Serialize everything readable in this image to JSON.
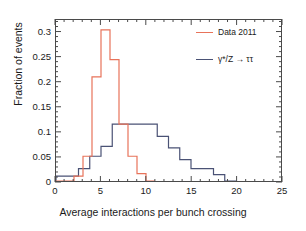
{
  "figure": {
    "background_color": "#ffffff",
    "frame_color": "#4a4a4a"
  },
  "axes": {
    "x": {
      "label": "Average interactions per bunch crossing",
      "ticks": [
        0,
        5,
        10,
        15,
        20,
        25
      ],
      "tick_labels": [
        "0",
        "5",
        "10",
        "15",
        "20",
        "25"
      ],
      "range": [
        0,
        25
      ],
      "minor_ticks_per_major": 5
    },
    "y": {
      "label": "Fraction of events",
      "ticks": [
        0,
        0.05,
        0.1,
        0.15,
        0.2,
        0.25,
        0.3
      ],
      "tick_labels": [
        "0",
        "0.05",
        "0.1",
        "0.15",
        "0.2",
        "0.25",
        "0.3"
      ],
      "range": [
        0,
        0.325
      ],
      "minor_ticks_per_major": 5
    }
  },
  "legend": {
    "position": "top-right",
    "entries": [
      {
        "label": "Data 2011",
        "color": "#e8735a",
        "marker": "step-line"
      },
      {
        "label": "γ*/Z → ττ",
        "color": "#4a5275",
        "marker": "step-line"
      }
    ]
  },
  "chart_data": {
    "type": "line",
    "subtype": "step-histogram",
    "title": "",
    "subtitle": "",
    "xlabel": "Average interactions per bunch crossing",
    "ylabel": "Fraction of events",
    "xlim": [
      0,
      25
    ],
    "ylim": [
      0,
      0.325
    ],
    "grid": false,
    "legend_position": "top-right",
    "series": [
      {
        "name": "Data 2011",
        "color": "#e8735a",
        "style": "step",
        "bin_edges": [
          0,
          1,
          2,
          3,
          4,
          5,
          6,
          7,
          8,
          9,
          10,
          11
        ],
        "values": [
          0.0,
          0.0,
          0.01,
          0.05,
          0.21,
          0.305,
          0.245,
          0.115,
          0.05,
          0.015,
          0.0
        ]
      },
      {
        "name": "γ*/Z → ττ",
        "color": "#4a5275",
        "style": "step",
        "bin_edges": [
          0,
          1.25,
          2.5,
          3.75,
          5.0,
          6.25,
          7.5,
          8.75,
          10.0,
          11.25,
          12.5,
          13.75,
          15.0,
          16.25,
          17.5,
          18.75,
          20.0
        ],
        "values": [
          0.01,
          0.01,
          0.025,
          0.05,
          0.07,
          0.115,
          0.115,
          0.115,
          0.115,
          0.09,
          0.067,
          0.043,
          0.025,
          0.025,
          0.013,
          0.0
        ]
      }
    ],
    "annotations": []
  }
}
